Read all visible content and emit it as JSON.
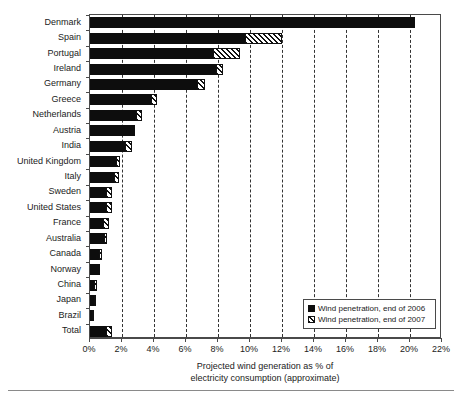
{
  "chart_data": {
    "type": "bar",
    "orientation": "horizontal",
    "stacked": true,
    "title": "",
    "xlabel": "Projected wind generation as % of electricity consumption (approximate)",
    "xlabel_line1": "Projected wind generation as % of",
    "xlabel_line2": "electricity consumption (approximate)",
    "ylabel": "",
    "xlim": [
      0,
      22
    ],
    "xtick_labels": [
      "0%",
      "2%",
      "4%",
      "6%",
      "8%",
      "10%",
      "12%",
      "14%",
      "16%",
      "18%",
      "20%",
      "22%"
    ],
    "xticks": [
      0,
      2,
      4,
      6,
      8,
      10,
      12,
      14,
      16,
      18,
      20,
      22
    ],
    "grid": "vertical-dashed",
    "legend_position": "bottom-right",
    "categories": [
      "Denmark",
      "Spain",
      "Portugal",
      "Ireland",
      "Germany",
      "Greece",
      "Netherlands",
      "Austria",
      "India",
      "United Kingdom",
      "Italy",
      "Sweden",
      "United States",
      "France",
      "Australia",
      "Canada",
      "Norway",
      "China",
      "Japan",
      "Brazil",
      "Total"
    ],
    "series": [
      {
        "name": "Wind penetration, end of 2006",
        "style": "solid-black",
        "color": "#0d0d0d",
        "values": [
          20.3,
          9.7,
          7.7,
          7.9,
          6.7,
          3.8,
          2.9,
          2.8,
          2.2,
          1.6,
          1.5,
          1.0,
          1.0,
          0.8,
          0.9,
          0.55,
          0.6,
          0.25,
          0.25,
          0.15,
          1.0
        ]
      },
      {
        "name": "Wind penetration, end of 2007",
        "style": "hatched",
        "color": "#ffffff",
        "values": [
          0.0,
          2.3,
          1.7,
          0.4,
          0.5,
          0.4,
          0.35,
          0.0,
          0.4,
          0.3,
          0.3,
          0.35,
          0.35,
          0.4,
          0.15,
          0.2,
          0.0,
          0.2,
          0.1,
          0.1,
          0.35
        ]
      }
    ],
    "totals": [
      20.3,
      12.0,
      9.4,
      8.3,
      7.2,
      4.2,
      3.25,
      2.8,
      2.6,
      1.9,
      1.8,
      1.35,
      1.35,
      1.2,
      1.05,
      0.75,
      0.6,
      0.45,
      0.35,
      0.25,
      1.35
    ]
  },
  "legend": {
    "items": [
      {
        "label": "Wind penetration, end of 2006"
      },
      {
        "label": "Wind penetration, end of 2007"
      }
    ]
  }
}
